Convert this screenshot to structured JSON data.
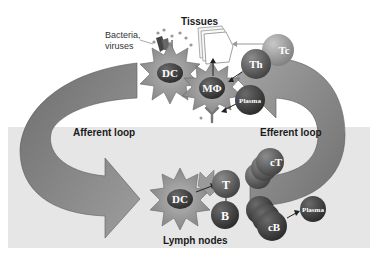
{
  "diagram": {
    "regions": {
      "tissues": "Tissues",
      "lymph_nodes": "Lymph nodes"
    },
    "loops": {
      "afferent": "Afferent loop",
      "efferent": "Efferent loop"
    },
    "pathogens_label_line1": "Bacteria,",
    "pathogens_label_line2": "viruses",
    "cells": {
      "dc_tissue": "DC",
      "macrophage": "MΦ",
      "tc": "Tc",
      "th": "Th",
      "plasma_tissue": "Plasma",
      "dc_node": "DC",
      "t_node": "T",
      "b_node": "B",
      "ct": "cT",
      "cb": "cB",
      "plasma_node": "Plasma"
    },
    "colors": {
      "lymph_background": "#e6e6e6",
      "arrow": "#8a8a8a",
      "cell_dark": "#3a3a3a",
      "cell_light": "#9a9a9a",
      "star": "#9c9c9c"
    }
  }
}
